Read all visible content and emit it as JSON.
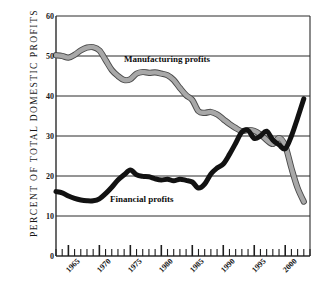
{
  "chart_data": {
    "type": "line",
    "title": "",
    "subtitle": "",
    "xlabel": "",
    "ylabel": "PERCENT OF TOTAL DOMESTIC PROFITS",
    "xlim": [
      1963,
      2004
    ],
    "ylim": [
      0,
      60
    ],
    "yticks": [
      0,
      10,
      20,
      30,
      40,
      50,
      60
    ],
    "xticks": [
      1965,
      1970,
      1975,
      1980,
      1985,
      1990,
      1995,
      2000
    ],
    "xtick_labels": [
      "1965",
      "1970",
      "1975",
      "1980",
      "1985",
      "1990",
      "1995",
      "2000"
    ],
    "ytick_labels": [
      "0",
      "10",
      "20",
      "30",
      "40",
      "50",
      "60"
    ],
    "grid": "horizontal",
    "legend_position": "inline-annotations",
    "minor_tick_interval": 1,
    "series": [
      {
        "name": "Manufacturing profits",
        "color": "#a8a8a8",
        "style": "thick-gray-outlined",
        "x": [
          1963,
          1964,
          1965,
          1966,
          1967,
          1968,
          1969,
          1970,
          1971,
          1972,
          1973,
          1974,
          1975,
          1976,
          1977,
          1978,
          1979,
          1980,
          1981,
          1982,
          1983,
          1984,
          1985,
          1986,
          1987,
          1988,
          1989,
          1990,
          1991,
          1992,
          1993,
          1994,
          1995,
          1996,
          1997,
          1998,
          1999,
          2000,
          2001,
          2002,
          2003
        ],
        "values": [
          50.2,
          50.0,
          49.6,
          50.3,
          51.4,
          52.1,
          52.2,
          51.4,
          49.0,
          46.5,
          45.0,
          44.0,
          44.2,
          45.6,
          46.0,
          45.8,
          45.9,
          45.6,
          45.2,
          44.0,
          42.0,
          40.2,
          39.0,
          36.2,
          35.8,
          36.0,
          35.4,
          34.2,
          33.0,
          32.0,
          31.2,
          31.5,
          31.3,
          30.4,
          29.0,
          28.0,
          29.5,
          27.6,
          22.0,
          17.0,
          13.6
        ]
      },
      {
        "name": "Financial profits",
        "color": "#121212",
        "style": "thick-black",
        "x": [
          1963,
          1964,
          1965,
          1966,
          1967,
          1968,
          1969,
          1970,
          1971,
          1972,
          1973,
          1974,
          1975,
          1976,
          1977,
          1978,
          1979,
          1980,
          1981,
          1982,
          1983,
          1984,
          1985,
          1986,
          1987,
          1988,
          1989,
          1990,
          1991,
          1992,
          1993,
          1994,
          1995,
          1996,
          1997,
          1998,
          1999,
          2000,
          2001,
          2002,
          2003
        ],
        "values": [
          16.1,
          15.8,
          15.0,
          14.4,
          14.0,
          13.8,
          13.8,
          14.3,
          15.6,
          17.2,
          19.0,
          20.3,
          21.5,
          20.3,
          19.9,
          19.8,
          19.3,
          19.0,
          19.2,
          18.8,
          19.2,
          18.9,
          18.5,
          17.0,
          18.0,
          20.5,
          22.0,
          23.0,
          25.4,
          28.2,
          31.0,
          31.4,
          29.4,
          30.0,
          31.2,
          29.0,
          27.8,
          26.8,
          30.0,
          34.5,
          39.3
        ]
      }
    ],
    "annotations": [
      {
        "text": "Manufacturing profits",
        "x": 1974.5,
        "y": 49.0
      },
      {
        "text": "Financial profits",
        "x": 1978.0,
        "y": 15.0
      }
    ]
  }
}
